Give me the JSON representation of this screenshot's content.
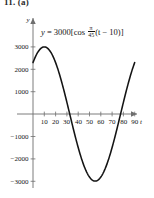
{
  "header": {
    "label": "11. (a)"
  },
  "equation": {
    "lhs": "y",
    "eq": "=",
    "amplitude": "3000",
    "open": "[cos",
    "frac_num": "π",
    "frac_den": "45",
    "rest": "(t − 10)]",
    "full_text": "y = 3000[cos π/45 (t − 10)]"
  },
  "axes": {
    "x_label": "t",
    "y_label": "y",
    "x_ticks": [
      "10",
      "20",
      "30",
      "40",
      "50",
      "60",
      "70",
      "80",
      "90"
    ],
    "y_ticks_positive": [
      "3000",
      "2000",
      "1000"
    ],
    "y_ticks_negative": [
      "−1000",
      "−2000",
      "−3000"
    ]
  },
  "colors": {
    "curve": "#141414",
    "axis": "#6e6e6e",
    "text": "#151515",
    "background": "#ffffff"
  },
  "chart_data": {
    "type": "line",
    "title": "",
    "subtitle": "",
    "xlabel": "t",
    "ylabel": "y",
    "xlim": [
      -4,
      95
    ],
    "ylim": [
      -3600,
      3600
    ],
    "grid": false,
    "legend": null,
    "annotations": [
      "y = 3000[cos π/45 (t − 10)]"
    ],
    "function": {
      "expression": "y = 3000*cos((pi/45)*(t-10))",
      "amplitude": 3000,
      "period": 90,
      "phase_shift": 10,
      "vertical_shift": 0
    },
    "xticks": [
      10,
      20,
      30,
      40,
      50,
      60,
      70,
      80,
      90
    ],
    "yticks": [
      -3000,
      -2000,
      -1000,
      1000,
      2000,
      3000
    ],
    "key_points": {
      "maximum": {
        "x": 10,
        "y": 3000
      },
      "minimum": {
        "x": 55,
        "y": -3000
      },
      "zeros": [
        32.5,
        77.5
      ],
      "start": {
        "x": 0,
        "y": 2298
      },
      "end": {
        "x": 90,
        "y": 2298
      }
    },
    "series": [
      {
        "name": "y = 3000 cos((pi/45)(t-10))",
        "x": [
          0,
          5,
          10,
          15,
          20,
          25,
          30,
          32.5,
          35,
          40,
          45,
          50,
          55,
          60,
          65,
          70,
          75,
          77.5,
          80,
          85,
          90
        ],
        "y": [
          2298,
          2898,
          3000,
          2898,
          2298,
          1290,
          104,
          0,
          -523,
          -1500,
          -2298,
          -2819,
          -3000,
          -2819,
          -2298,
          -1500,
          -523,
          0,
          104,
          1290,
          2298
        ]
      }
    ]
  }
}
